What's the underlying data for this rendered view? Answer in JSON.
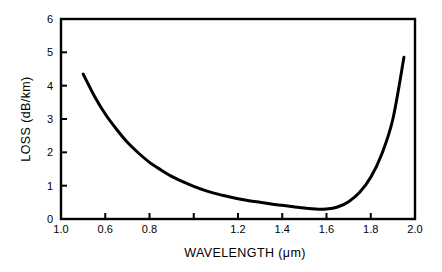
{
  "chart_data": {
    "type": "line",
    "title": "",
    "xlabel": "WAVELENGTH (μm)",
    "ylabel": "LOSS (dB/km)",
    "xlim": [
      0.4,
      2.0
    ],
    "ylim": [
      0,
      6
    ],
    "grid": false,
    "legend": null,
    "xticks": [
      0.4,
      0.6,
      0.8,
      1.0,
      1.2,
      1.4,
      1.6,
      1.8,
      2.0
    ],
    "xtick_labels": [
      "1.0",
      "0.6",
      "0.8",
      "",
      "1.2",
      "1.4",
      "1.6",
      "1.8",
      "2.0"
    ],
    "yticks": [
      0,
      1,
      2,
      3,
      4,
      5,
      6
    ],
    "ytick_labels": [
      "0",
      "1",
      "2",
      "3",
      "4",
      "5",
      "6"
    ],
    "series": [
      {
        "name": "fiber attenuation",
        "color": "#000000",
        "linewidth": 3,
        "x": [
          0.5,
          0.55,
          0.6,
          0.65,
          0.7,
          0.75,
          0.8,
          0.85,
          0.9,
          0.95,
          1.0,
          1.05,
          1.1,
          1.15,
          1.2,
          1.25,
          1.3,
          1.35,
          1.4,
          1.45,
          1.5,
          1.55,
          1.6,
          1.65,
          1.7,
          1.75,
          1.8,
          1.85,
          1.9,
          1.95
        ],
        "y": [
          4.35,
          3.7,
          3.15,
          2.7,
          2.3,
          1.98,
          1.7,
          1.48,
          1.28,
          1.12,
          0.98,
          0.86,
          0.76,
          0.68,
          0.61,
          0.55,
          0.5,
          0.45,
          0.41,
          0.37,
          0.33,
          0.3,
          0.3,
          0.36,
          0.52,
          0.8,
          1.25,
          1.95,
          3.0,
          4.85
        ]
      }
    ]
  },
  "axes": {
    "x_title": "WAVELENGTH (μm)",
    "y_title": "LOSS (dB/km)"
  }
}
